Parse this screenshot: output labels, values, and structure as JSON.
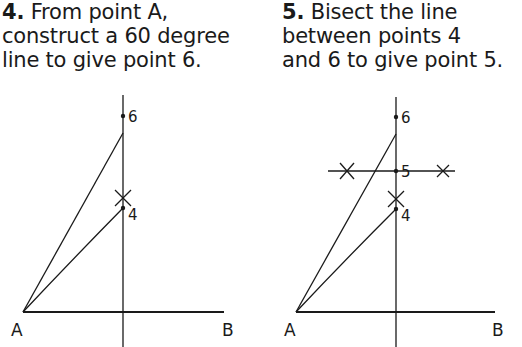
{
  "steps": [
    {
      "number": "4.",
      "lines": [
        "From point A,",
        "construct a 60 degree",
        "line to give point 6."
      ]
    },
    {
      "number": "5.",
      "lines": [
        "Bisect the line",
        "between points 4",
        "and 6 to give point 5."
      ]
    }
  ],
  "diagrams": [
    {
      "labels": {
        "A": "A",
        "B": "B",
        "p6": "6",
        "p4": "4"
      }
    },
    {
      "labels": {
        "A": "A",
        "B": "B",
        "p6": "6",
        "p5": "5",
        "p4": "4"
      }
    }
  ],
  "colors": {
    "ink": "#1a1a1a",
    "background": "#ffffff"
  }
}
